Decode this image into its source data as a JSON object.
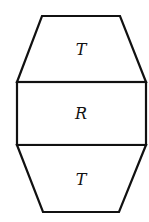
{
  "diagram": {
    "title": "",
    "shapes": [
      {
        "id": "top-trapezoid",
        "type": "trapezoid",
        "label": "T",
        "points": [
          [
            42,
            16
          ],
          [
            120,
            16
          ],
          [
            146,
            82
          ],
          [
            17,
            82
          ]
        ]
      },
      {
        "id": "middle-rectangle",
        "type": "rectangle",
        "label": "R",
        "x": 17,
        "y": 82,
        "width": 129,
        "height": 63
      },
      {
        "id": "bottom-trapezoid",
        "type": "trapezoid",
        "label": "T",
        "points": [
          [
            17,
            145
          ],
          [
            146,
            145
          ],
          [
            119,
            212
          ],
          [
            43,
            212
          ]
        ]
      }
    ],
    "colors": {
      "stroke": "#111111",
      "fill": "#ffffff",
      "background": "#ffffff"
    }
  },
  "labels": {
    "top": "T",
    "middle": "R",
    "bottom": "T"
  }
}
